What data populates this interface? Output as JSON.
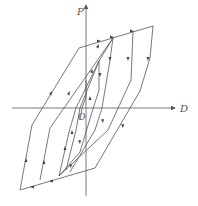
{
  "diagram": {
    "type": "hysteresis-loop",
    "colors": {
      "line": "#555555",
      "background": "#ffffff"
    },
    "axes": {
      "y_label": "P",
      "x_label": "D",
      "origin_label": "O"
    },
    "loops": [
      {
        "name": "loop-1",
        "points": [
          [
            113,
            38
          ],
          [
            99,
            61
          ],
          [
            88,
            97
          ],
          [
            81,
            120
          ],
          [
            80,
            152
          ],
          [
            59,
            176
          ],
          [
            76,
            152
          ],
          [
            80,
            120
          ],
          [
            86,
            97
          ],
          [
            99,
            61
          ]
        ]
      },
      {
        "name": "loop-2",
        "points": [
          [
            113,
            38
          ],
          [
            110,
            60
          ],
          [
            102,
            108
          ],
          [
            95,
            132
          ],
          [
            59,
            176
          ],
          [
            69,
            132
          ],
          [
            76,
            108
          ],
          [
            93,
            62
          ]
        ]
      },
      {
        "name": "loop-3",
        "points": [
          [
            133,
            31
          ],
          [
            131,
            80
          ],
          [
            108,
            130
          ],
          [
            70,
            173
          ],
          [
            59,
            176
          ],
          [
            40,
            180
          ],
          [
            50,
            128
          ],
          [
            90,
            44
          ]
        ]
      },
      {
        "name": "outer-loop",
        "points": [
          [
            153,
            26
          ],
          [
            150,
            58
          ],
          [
            140,
            91
          ],
          [
            95,
            168
          ],
          [
            20,
            190
          ],
          [
            32,
            125
          ],
          [
            79,
            48
          ]
        ]
      }
    ]
  }
}
